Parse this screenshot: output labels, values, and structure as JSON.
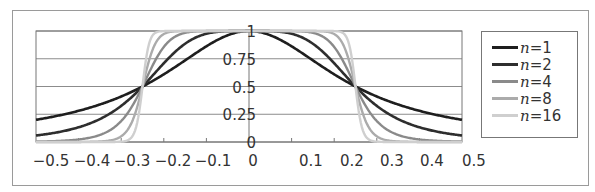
{
  "chart_data": {
    "type": "line",
    "title": "",
    "xlabel": "",
    "ylabel": "",
    "xlim": [
      -0.5,
      0.5
    ],
    "ylim": [
      0,
      1
    ],
    "grid": true,
    "legend_position": "right",
    "x_tick_labels": [
      "-0.5",
      "-0.4",
      "-0.3",
      "-0.2",
      "-0.1",
      "0",
      "0.1",
      "0.2",
      "0.3",
      "0.4",
      "0.5"
    ],
    "y_tick_labels": [
      "0",
      "0.25",
      "0.5",
      "0.75",
      "1"
    ],
    "y_ticks": [
      0,
      0.25,
      0.5,
      0.75,
      1
    ],
    "x": [
      -0.5,
      -0.45,
      -0.4,
      -0.35,
      -0.3,
      -0.25,
      -0.2,
      -0.15,
      -0.1,
      -0.05,
      0,
      0.05,
      0.1,
      0.15,
      0.2,
      0.25,
      0.3,
      0.35,
      0.4,
      0.45,
      0.5
    ],
    "series": [
      {
        "name": "n=1",
        "n": 1,
        "color": "#1e1e1e",
        "width": 2.6,
        "values": [
          0.2,
          0.236,
          0.281,
          0.338,
          0.41,
          0.5,
          0.61,
          0.735,
          0.862,
          0.962,
          1,
          0.962,
          0.862,
          0.735,
          0.61,
          0.5,
          0.41,
          0.338,
          0.281,
          0.236,
          0.2
        ]
      },
      {
        "name": "n=2",
        "n": 2,
        "color": "#2e2e2e",
        "width": 2.6,
        "values": [
          0.059,
          0.087,
          0.133,
          0.207,
          0.325,
          0.5,
          0.709,
          0.885,
          0.975,
          0.998,
          1,
          0.998,
          0.975,
          0.885,
          0.709,
          0.5,
          0.325,
          0.207,
          0.133,
          0.087,
          0.059
        ]
      },
      {
        "name": "n=4",
        "n": 4,
        "color": "#8a8a8a",
        "width": 2.4,
        "values": [
          0.004,
          0.009,
          0.023,
          0.064,
          0.188,
          0.5,
          0.856,
          0.983,
          0.999,
          1,
          1,
          1,
          0.999,
          0.983,
          0.856,
          0.5,
          0.188,
          0.064,
          0.023,
          0.009,
          0.004
        ]
      },
      {
        "name": "n=8",
        "n": 8,
        "color": "#ababab",
        "width": 2.4,
        "values": [
          0,
          0,
          0.001,
          0.005,
          0.051,
          0.5,
          0.973,
          1,
          1,
          1,
          1,
          1,
          1,
          1,
          0.973,
          0.5,
          0.051,
          0.005,
          0.001,
          0,
          0
        ]
      },
      {
        "name": "n=16",
        "n": 16,
        "color": "#cfcfcf",
        "width": 2.4,
        "values": [
          0,
          0,
          0,
          0,
          0.003,
          0.5,
          0.999,
          1,
          1,
          1,
          1,
          1,
          1,
          1,
          0.999,
          0.5,
          0.003,
          0,
          0,
          0,
          0
        ]
      }
    ],
    "annotations": [],
    "formula_hint": "y = 1 / (1 + (|x|/0.25)^(2n))"
  },
  "legend": {
    "items": [
      {
        "var": "n",
        "eq": "=1",
        "color": "#1e1e1e"
      },
      {
        "var": "n",
        "eq": "=2",
        "color": "#2e2e2e"
      },
      {
        "var": "n",
        "eq": "=4",
        "color": "#8a8a8a"
      },
      {
        "var": "n",
        "eq": "=8",
        "color": "#ababab"
      },
      {
        "var": "n",
        "eq": "=16",
        "color": "#cfcfcf"
      }
    ]
  }
}
